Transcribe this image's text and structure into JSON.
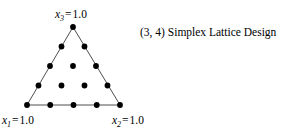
{
  "figure": {
    "caption": "(3, 4) Simplex Lattice Design",
    "background_color": "#ffffff",
    "ink_color": "#000000",
    "edge_color": "#3a3a3a"
  },
  "vertex_labels": {
    "top": {
      "variable": "x",
      "subscript": "3",
      "equals": "=",
      "value": "1.0",
      "full_text": "x3 = 1.0"
    },
    "bottom_left": {
      "variable": "x",
      "subscript": "1",
      "equals": "=",
      "value": "1.0",
      "full_text": "x1 = 1.0"
    },
    "bottom_right": {
      "variable": "x",
      "subscript": "2",
      "equals": "=",
      "value": "1.0",
      "full_text": "x2 = 1.0"
    }
  },
  "chart_data": {
    "type": "scatter",
    "title": "(3, 4) Simplex Lattice Design",
    "subtitle": "",
    "plot_shape": "equilateral-triangle-simplex",
    "components": 3,
    "degree": 4,
    "n_points": 15,
    "xlabel": "",
    "ylabel": "",
    "grid": false,
    "legend": null,
    "axis_labels": [
      "x1 = 1.0",
      "x2 = 1.0",
      "x3 = 1.0"
    ],
    "vertices_pixels": {
      "top": [
        73,
        27
      ],
      "bottom_left": [
        27,
        105
      ],
      "bottom_right": [
        120,
        105
      ]
    },
    "dot_radius_px": 2.9,
    "edge_width_px": 0.9,
    "rows": [
      {
        "row": 1,
        "count": 1
      },
      {
        "row": 2,
        "count": 2
      },
      {
        "row": 3,
        "count": 3
      },
      {
        "row": 4,
        "count": 4
      },
      {
        "row": 5,
        "count": 5
      }
    ],
    "barycentric_points": [
      [
        0.0,
        0.0,
        1.0
      ],
      [
        0.25,
        0.0,
        0.75
      ],
      [
        0.0,
        0.25,
        0.75
      ],
      [
        0.5,
        0.0,
        0.5
      ],
      [
        0.25,
        0.25,
        0.5
      ],
      [
        0.0,
        0.5,
        0.5
      ],
      [
        0.75,
        0.0,
        0.25
      ],
      [
        0.5,
        0.25,
        0.25
      ],
      [
        0.25,
        0.5,
        0.25
      ],
      [
        0.0,
        0.75,
        0.25
      ],
      [
        1.0,
        0.0,
        0.0
      ],
      [
        0.75,
        0.25,
        0.0
      ],
      [
        0.5,
        0.5,
        0.0
      ],
      [
        0.25,
        0.75,
        0.0
      ],
      [
        0.0,
        1.0,
        0.0
      ]
    ],
    "points_pixels": [
      [
        73.0,
        27.0
      ],
      [
        61.5,
        46.5
      ],
      [
        84.5,
        46.5
      ],
      [
        50.0,
        66.0
      ],
      [
        73.0,
        66.0
      ],
      [
        96.0,
        66.0
      ],
      [
        38.5,
        85.5
      ],
      [
        61.5,
        85.5
      ],
      [
        84.5,
        85.5
      ],
      [
        107.5,
        85.5
      ],
      [
        27.0,
        105.0
      ],
      [
        50.25,
        105.0
      ],
      [
        73.5,
        105.0
      ],
      [
        96.75,
        105.0
      ],
      [
        120.0,
        105.0
      ]
    ]
  }
}
